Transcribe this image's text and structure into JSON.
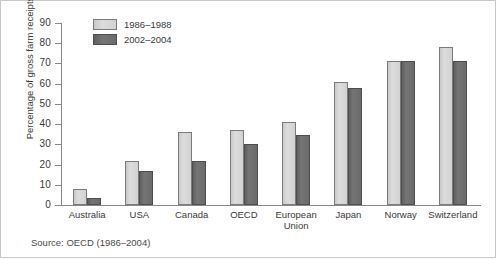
{
  "chart_data": {
    "type": "bar",
    "title": "",
    "xlabel": "",
    "ylabel": "Percentage of gross farm receipts",
    "ylim": [
      0,
      90
    ],
    "ytick_step": 10,
    "yticks": [
      0,
      10,
      20,
      30,
      40,
      50,
      60,
      70,
      80,
      90
    ],
    "grid": false,
    "legend_position": "top-left",
    "categories": [
      "Australia",
      "USA",
      "Canada",
      "OECD",
      "European\nUnion",
      "Japan",
      "Norway",
      "Switzerland"
    ],
    "category_labels": [
      "Australia",
      "USA",
      "Canada",
      "OECD",
      "European Union",
      "Japan",
      "Norway",
      "Switzerland"
    ],
    "series": [
      {
        "name": "1986–1988",
        "color": "#d2d2d2",
        "values": [
          8,
          22,
          36,
          37,
          41,
          61,
          71,
          78
        ]
      },
      {
        "name": "2002–2004",
        "color": "#6a6a6a",
        "values": [
          3.5,
          17,
          22,
          30,
          34.5,
          58,
          71,
          71
        ]
      }
    ],
    "source": "Source: OECD (1986–2004)"
  },
  "legend": {
    "items": [
      {
        "label": "1986–1988",
        "swatch": "light"
      },
      {
        "label": "2002–2004",
        "swatch": "dark"
      }
    ]
  },
  "axis": {
    "y_title": "Percentage of gross farm receipts",
    "y_tick_labels": [
      "90",
      "80",
      "70",
      "60",
      "50",
      "40",
      "30",
      "20",
      "10",
      "0"
    ]
  },
  "footer": {
    "source": "Source: OECD (1986–2004)"
  },
  "colors": {
    "light_bar": "#d2d2d2",
    "dark_bar": "#6a6a6a",
    "axis": "#888888",
    "text": "#3a3a3a",
    "border": "#c8c8c8",
    "background": "#ffffff"
  }
}
